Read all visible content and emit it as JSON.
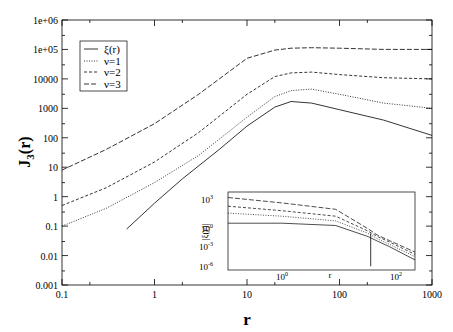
{
  "chart_data": [
    {
      "type": "line",
      "title": "",
      "xlabel": "r",
      "ylabel": "J_3(r)",
      "xscale": "log",
      "yscale": "log",
      "xlim": [
        0.1,
        1000
      ],
      "ylim": [
        0.001,
        1000000
      ],
      "x_ticks": [
        "0.1",
        "1",
        "10",
        "100",
        "1000"
      ],
      "y_ticks": [
        "0.001",
        "0.01",
        "0.1",
        "1",
        "10",
        "100",
        "1000",
        "10000",
        "1e+05",
        "1e+06"
      ],
      "legend": {
        "position": "upper-left",
        "entries": [
          "ξ(r)",
          "ν=1",
          "ν=2",
          "ν=3"
        ]
      },
      "series": [
        {
          "name": "ξ(r)",
          "style": "solid",
          "x": [
            0.5,
            1,
            2,
            5,
            10,
            20,
            30,
            50,
            100,
            300,
            1000
          ],
          "y": [
            0.08,
            0.6,
            4,
            40,
            250,
            1100,
            1700,
            1500,
            900,
            400,
            120
          ]
        },
        {
          "name": "ν=1",
          "style": "dotted",
          "x": [
            0.1,
            0.3,
            1,
            3,
            10,
            20,
            30,
            50,
            100,
            300,
            1000
          ],
          "y": [
            0.1,
            0.4,
            3,
            25,
            500,
            2500,
            4000,
            4500,
            3000,
            1500,
            1000
          ]
        },
        {
          "name": "ν=2",
          "style": "dashed",
          "x": [
            0.1,
            0.3,
            1,
            3,
            10,
            20,
            30,
            50,
            100,
            300,
            1000
          ],
          "y": [
            0.5,
            2,
            15,
            150,
            3000,
            12000,
            16000,
            17000,
            14000,
            11000,
            10000
          ]
        },
        {
          "name": "ν=3",
          "style": "long-dashed",
          "x": [
            0.1,
            0.3,
            1,
            3,
            10,
            20,
            30,
            50,
            100,
            300,
            1000
          ],
          "y": [
            8,
            40,
            300,
            3000,
            50000,
            95000,
            110000,
            115000,
            110000,
            100000,
            100000
          ]
        }
      ]
    },
    {
      "type": "line",
      "title": "inset",
      "xlabel": "r",
      "ylabel": "|ξ(r)|",
      "xscale": "log",
      "yscale": "log",
      "x_ticks": [
        "10^0",
        "10^2"
      ],
      "y_ticks": [
        "10^-6",
        "10^-3",
        "10^0",
        "10^3"
      ],
      "series": [
        {
          "name": "ξ(r)",
          "style": "solid",
          "x": [
            0.1,
            1,
            10,
            40,
            60,
            100,
            300
          ],
          "y": [
            1,
            1,
            0.5,
            0.02,
            0.005,
            0.001,
            2e-05
          ]
        },
        {
          "name": "ν=1",
          "style": "dotted",
          "x": [
            0.1,
            1,
            10,
            40,
            60,
            100,
            300
          ],
          "y": [
            20,
            8,
            2,
            0.05,
            0.01,
            0.002,
            5e-05
          ]
        },
        {
          "name": "ν=2",
          "style": "dashed",
          "x": [
            0.1,
            1,
            10,
            40,
            60,
            100,
            300
          ],
          "y": [
            150,
            40,
            8,
            0.1,
            0.02,
            0.004,
            0.0001
          ]
        },
        {
          "name": "ν=3",
          "style": "long-dashed",
          "x": [
            0.1,
            1,
            10,
            40,
            60,
            100,
            300
          ],
          "y": [
            2000,
            400,
            60,
            0.2,
            0.03,
            0.006,
            0.0002
          ]
        }
      ]
    }
  ],
  "labels": {
    "xlabel": "r",
    "ylabel_main": "J",
    "ylabel_sub": "3",
    "ylabel_tail": "(r)",
    "inset_xlabel": "r",
    "inset_ylabel": "|ξ(r)|",
    "legend": [
      "ξ(r)",
      "ν=1",
      "ν=2",
      "ν=3"
    ],
    "x_ticks": [
      "0.1",
      "1",
      "10",
      "100",
      "1000"
    ],
    "y_ticks": [
      "0.001",
      "0.01",
      "0.1",
      "1",
      "10",
      "100",
      "1000",
      "10000",
      "1e+05",
      "1e+06"
    ]
  }
}
